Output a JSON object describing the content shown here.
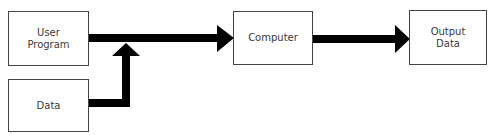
{
  "diagram": {
    "type": "flow",
    "nodes": [
      {
        "id": "user_program",
        "label_lines": [
          "User",
          "Program"
        ]
      },
      {
        "id": "data",
        "label_lines": [
          "Data"
        ]
      },
      {
        "id": "computer",
        "label_lines": [
          "Computer"
        ]
      },
      {
        "id": "output_data",
        "label_lines": [
          "Output",
          "Data"
        ]
      }
    ],
    "edges": [
      {
        "from": "user_program",
        "to": "computer"
      },
      {
        "from": "data",
        "to": "user_program->computer (merge)"
      },
      {
        "from": "computer",
        "to": "output_data"
      }
    ],
    "colors": {
      "arrow": "#000000",
      "box_border": "#444444",
      "text": "#3a3a3a"
    }
  }
}
